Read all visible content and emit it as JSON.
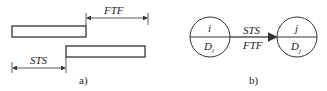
{
  "panel_a": {
    "caption": "a)",
    "ftf_label": "FTF",
    "sts_label": "STS"
  },
  "panel_b": {
    "caption": "b)",
    "node_i": {
      "top": "i",
      "bottom": "D",
      "bottom_sub": "i"
    },
    "node_j": {
      "top": "j",
      "bottom": "D",
      "bottom_sub": "j"
    },
    "link_top": "STS",
    "link_bottom": "FTF"
  },
  "colors": {
    "line": "#333333",
    "background": "#ffffff"
  }
}
